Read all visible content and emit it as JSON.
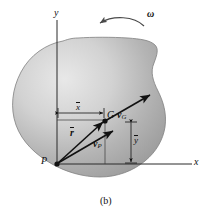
{
  "figure": {
    "caption": "(b)"
  },
  "axes": {
    "y_label": "y",
    "x_label": "x",
    "origin_point_label": "P"
  },
  "points": [
    {
      "id": "P",
      "label": "P"
    },
    {
      "id": "G",
      "label": "G"
    }
  ],
  "vectors": [
    {
      "id": "r",
      "label": "r",
      "overbar": true,
      "bold": true
    },
    {
      "id": "vP",
      "label": "v",
      "subscript": "P",
      "bold": true
    },
    {
      "id": "vG",
      "label": "v",
      "subscript": "G",
      "bold": true
    }
  ],
  "dimensions": [
    {
      "id": "xbar",
      "label": "x",
      "overbar": true
    },
    {
      "id": "ybar",
      "label": "y",
      "overbar": true
    }
  ],
  "angular_velocity": {
    "label": "ω",
    "direction": "counterclockwise"
  },
  "colors": {
    "body_light": "#e3e3e3",
    "body_mid": "#b9b9b9",
    "body_dark": "#8f8f8f",
    "outline": "#6e6e6e",
    "ink": "#111111",
    "background": "#ffffff"
  }
}
